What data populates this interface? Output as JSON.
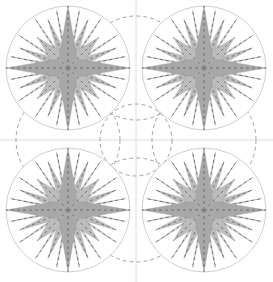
{
  "diagram": {
    "width": 273,
    "height": 282,
    "background": "#ffffff",
    "grid_line_color": "#dcdcdc",
    "outer_circle_color": "#cfcfcf",
    "dash_color": "#8a8a8a",
    "light_fill": "#d9d9d9",
    "mid_fill": "#bdbdbd",
    "dark_fill": "#a8a8a8",
    "stars": [
      {
        "cx": 68,
        "cy": 68,
        "r": 62
      },
      {
        "cx": 204,
        "cy": 68,
        "r": 62
      },
      {
        "cx": 68,
        "cy": 210,
        "r": 62
      },
      {
        "cx": 204,
        "cy": 210,
        "r": 62
      }
    ],
    "dashed_circles": [
      {
        "cx": 136,
        "cy": 68,
        "r": 52
      },
      {
        "cx": 68,
        "cy": 140,
        "r": 52
      },
      {
        "cx": 204,
        "cy": 140,
        "r": 52
      },
      {
        "cx": 136,
        "cy": 210,
        "r": 52
      },
      {
        "cx": 136,
        "cy": 140,
        "r": 36
      }
    ],
    "axis": {
      "x": 136,
      "y": 140
    }
  }
}
